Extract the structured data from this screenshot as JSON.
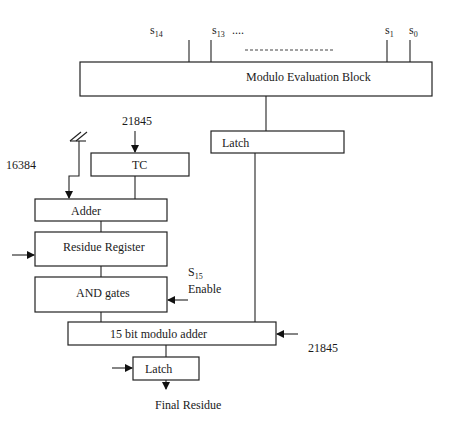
{
  "diagram": {
    "signals_top": [
      {
        "base": "s",
        "sub": "14"
      },
      {
        "base": "s",
        "sub": "13"
      },
      {
        "base": "s",
        "sub": "1"
      },
      {
        "base": "s",
        "sub": "0"
      }
    ],
    "ellipsis": "....",
    "blocks": {
      "modulo_eval": "Modulo Evaluation Block",
      "latch_top": "Latch",
      "tc": "TC",
      "adder": "Adder",
      "residue_register": "Residue Register",
      "and_gates": "AND gates",
      "modulo_adder_15": "15 bit modulo adder",
      "latch_bottom": "Latch"
    },
    "inputs": {
      "tc_input": "21845",
      "adder_input": "16384",
      "s15_base": "S",
      "s15_sub": "15",
      "enable": "Enable",
      "modulo_adder_input": "21845"
    },
    "output": "Final Residue"
  }
}
